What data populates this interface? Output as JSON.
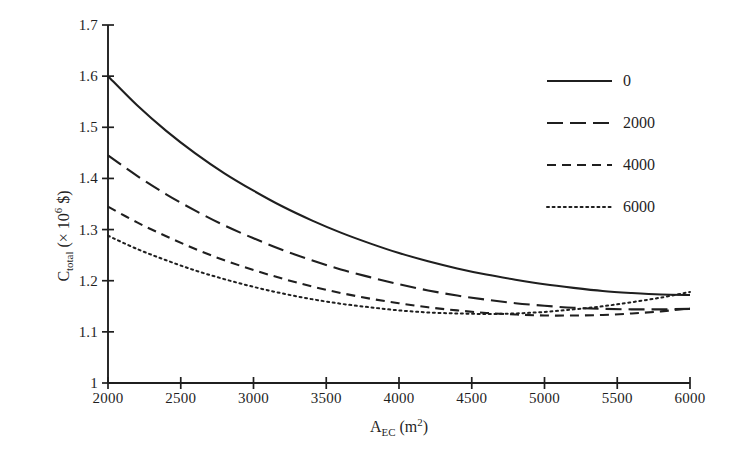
{
  "chart_data": {
    "type": "line",
    "title": "",
    "xlabel": "A_EC (m^2)",
    "xlabel_parts": {
      "main": "A",
      "sub": "EC",
      "unit_open": " (m",
      "unit_sup": "2",
      "unit_close": ")"
    },
    "ylabel": "C_total (× 10^6 $)",
    "ylabel_parts": {
      "main": "C",
      "sub": "total",
      "rest_open": " (× 10",
      "sup": "6",
      "rest_close": " $)"
    },
    "xlim": [
      2000,
      6000
    ],
    "ylim": [
      1.0,
      1.7
    ],
    "xticks": [
      2000,
      2500,
      3000,
      3500,
      4000,
      4500,
      5000,
      5500,
      6000
    ],
    "xtick_labels": [
      "2000",
      "2500",
      "3000",
      "3500",
      "4000",
      "4500",
      "5000",
      "5500",
      "6000"
    ],
    "yticks": [
      1.0,
      1.1,
      1.2,
      1.3,
      1.4,
      1.5,
      1.6,
      1.7
    ],
    "ytick_labels": [
      "1",
      "1.1",
      "1.2",
      "1.3",
      "1.4",
      "1.5",
      "1.6",
      "1.7"
    ],
    "grid": false,
    "legend_position": "upper right",
    "line_color": "#1f1f1f",
    "x": [
      2000,
      2200,
      2400,
      2600,
      2800,
      3000,
      3200,
      3400,
      3600,
      3800,
      4000,
      4200,
      4400,
      4600,
      4800,
      5000,
      5200,
      5400,
      5600,
      5800,
      6000
    ],
    "series": [
      {
        "name": "0",
        "dash": "solid",
        "values": [
          1.6,
          1.543,
          1.493,
          1.449,
          1.41,
          1.376,
          1.345,
          1.318,
          1.294,
          1.273,
          1.254,
          1.238,
          1.224,
          1.212,
          1.202,
          1.193,
          1.186,
          1.18,
          1.176,
          1.173,
          1.172
        ]
      },
      {
        "name": "2000",
        "dash": "long-dash",
        "values": [
          1.445,
          1.405,
          1.369,
          1.337,
          1.308,
          1.283,
          1.26,
          1.24,
          1.222,
          1.207,
          1.193,
          1.181,
          1.171,
          1.163,
          1.156,
          1.151,
          1.147,
          1.145,
          1.144,
          1.144,
          1.145
        ]
      },
      {
        "name": "4000",
        "dash": "dash",
        "values": [
          1.345,
          1.314,
          1.287,
          1.262,
          1.24,
          1.221,
          1.204,
          1.189,
          1.176,
          1.165,
          1.156,
          1.148,
          1.142,
          1.137,
          1.134,
          1.132,
          1.132,
          1.133,
          1.136,
          1.14,
          1.146
        ]
      },
      {
        "name": "6000",
        "dash": "dotted",
        "values": [
          1.288,
          1.262,
          1.24,
          1.22,
          1.203,
          1.188,
          1.175,
          1.164,
          1.155,
          1.148,
          1.142,
          1.138,
          1.136,
          1.135,
          1.136,
          1.139,
          1.144,
          1.15,
          1.158,
          1.167,
          1.178
        ]
      }
    ],
    "legend_entries": [
      {
        "label": "0",
        "dash": "solid"
      },
      {
        "label": "2000",
        "dash": "long-dash"
      },
      {
        "label": "4000",
        "dash": "dash"
      },
      {
        "label": "6000",
        "dash": "dotted"
      }
    ]
  }
}
